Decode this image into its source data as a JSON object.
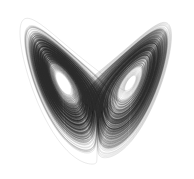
{
  "figure": {
    "name": "lorenz-attractor-plot",
    "title": "Lorenz attractor",
    "caption": "",
    "background_color": "#ffffff",
    "stroke_color": "#1a1a1a",
    "width_px": 194,
    "height_px": 179
  },
  "chart_data": {
    "type": "line",
    "title": "Lorenz attractor",
    "subtitle": "",
    "xlabel": "",
    "ylabel": "",
    "annotations": [],
    "legend": [],
    "legend_position": "none",
    "grid": false,
    "axes_visible": false,
    "projection": "x-z plane",
    "xlim": [
      -21,
      21
    ],
    "ylim": [
      0,
      50
    ],
    "system": {
      "name": "Lorenz system",
      "equations": [
        "dx/dt = sigma*(y - x)",
        "dy/dt = x*(rho - z) - y",
        "dz/dt = x*y - beta*z"
      ],
      "sigma": 10,
      "rho": 28,
      "beta": 2.6666666667
    },
    "integration": {
      "method": "rk4",
      "dt": 0.0035,
      "steps": 34000,
      "transient_skip": 400
    },
    "initial_conditions": [
      {
        "x": 0.8,
        "y": 1.2,
        "z": 11.0
      },
      {
        "x": -6.2,
        "y": 4.5,
        "z": 21.0
      },
      {
        "x": 9.4,
        "y": -3.1,
        "z": 27.5
      },
      {
        "x": -1.5,
        "y": -8.2,
        "z": 33.0
      },
      {
        "x": 4.1,
        "y": 7.7,
        "z": 16.5
      }
    ],
    "series": [
      {
        "name": "orbit-1",
        "stroke": "#2b2b2b",
        "width": 0.23,
        "opacity": 0.62
      },
      {
        "name": "orbit-2",
        "stroke": "#303030",
        "width": 0.22,
        "opacity": 0.55
      },
      {
        "name": "orbit-3",
        "stroke": "#262626",
        "width": 0.23,
        "opacity": 0.58
      },
      {
        "name": "orbit-4",
        "stroke": "#333333",
        "width": 0.21,
        "opacity": 0.5
      },
      {
        "name": "orbit-5",
        "stroke": "#2e2e2e",
        "width": 0.22,
        "opacity": 0.54
      }
    ],
    "fixed_points": [
      {
        "label": "C+",
        "x": 8.485,
        "z": 27
      },
      {
        "label": "C-",
        "x": -8.485,
        "z": 27
      },
      {
        "label": "origin",
        "x": 0,
        "z": 0
      }
    ]
  }
}
